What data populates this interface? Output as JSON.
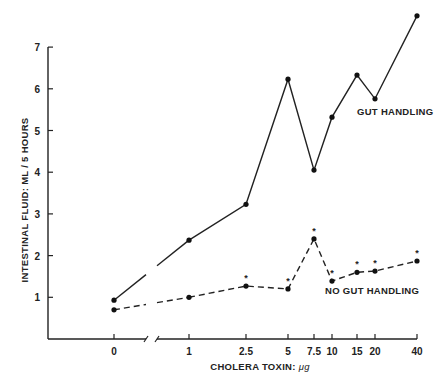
{
  "chart_data": {
    "type": "line",
    "title": "",
    "xlabel": "CHOLERA TOXIN: μg",
    "ylabel": "INTESTINAL FLUID: ML / 5 HOURS",
    "x_scale": "categorical (log-like) with axis break between 0 and 1",
    "categories": [
      "0",
      "1",
      "2.5",
      "5",
      "7.5",
      "10",
      "15",
      "20",
      "40"
    ],
    "ylim": [
      0,
      7
    ],
    "yticks": [
      "1",
      "2",
      "3",
      "4",
      "5",
      "6",
      "7"
    ],
    "grid": false,
    "series": [
      {
        "name": "GUT HANDLING",
        "style": "solid",
        "values": [
          0.93,
          2.37,
          3.23,
          6.23,
          4.05,
          5.32,
          6.33,
          5.76,
          7.75
        ]
      },
      {
        "name": "NO GUT HANDLING",
        "style": "dashed",
        "values": [
          0.7,
          1.0,
          1.27,
          1.2,
          2.4,
          1.39,
          1.6,
          1.63,
          1.87
        ],
        "significance_markers": [
          "2.5",
          "5",
          "7.5",
          "10",
          "15",
          "20",
          "40"
        ]
      }
    ],
    "annotations": [
      {
        "text": "GUT HANDLING",
        "near_series": "GUT HANDLING"
      },
      {
        "text": "NO GUT HANDLING",
        "near_series": "NO GUT HANDLING"
      },
      {
        "text": "*",
        "meaning": "significance marker above NO GUT HANDLING points"
      }
    ]
  },
  "labels": {
    "ylabel": "INTESTINAL FLUID: ML / 5 HOURS",
    "xlabel_main": "CHOLERA TOXIN: ",
    "xlabel_unit": "μg",
    "gut": "GUT HANDLING",
    "nogut": "NO GUT HANDLING",
    "asterisk": "*"
  }
}
